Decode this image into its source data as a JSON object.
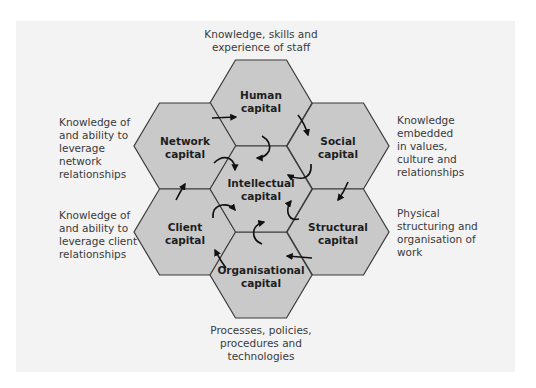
{
  "colors": {
    "panel_background": "#f3f3f3",
    "hex_fill": "#c9c9c9",
    "hex_stroke": "#3a3a3a",
    "arrow": "#111111",
    "text": "#3a3a3a"
  },
  "hexagons": [
    {
      "id": "human",
      "lines": [
        "Human",
        "capital"
      ]
    },
    {
      "id": "network",
      "lines": [
        "Network",
        "capital"
      ]
    },
    {
      "id": "social",
      "lines": [
        "Social",
        "capital"
      ]
    },
    {
      "id": "intellectual",
      "lines": [
        "Intellectual",
        "capital"
      ]
    },
    {
      "id": "client",
      "lines": [
        "Client",
        "capital"
      ]
    },
    {
      "id": "structural",
      "lines": [
        "Structural",
        "capital"
      ]
    },
    {
      "id": "organisational",
      "lines": [
        "Organisational",
        "capital"
      ]
    }
  ],
  "annotations": {
    "top": [
      "Knowledge, skills and",
      "experience of staff"
    ],
    "upper_left": [
      "Knowledge of",
      "and ability to",
      "leverage",
      "network",
      "relationships"
    ],
    "lower_left": [
      "Knowledge of",
      "and ability to",
      "leverage client",
      "relationships"
    ],
    "upper_right": [
      "Knowledge",
      "embedded",
      "in values,",
      "culture and",
      "relationships"
    ],
    "lower_right": [
      "Physical",
      "structuring and",
      "organisation of",
      "work"
    ],
    "bottom": [
      "Processes, policies,",
      "procedures and",
      "technologies"
    ]
  }
}
